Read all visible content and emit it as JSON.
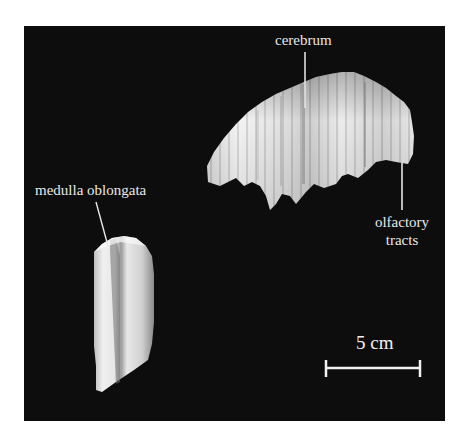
{
  "figure": {
    "background": "#0d0d0d",
    "labels": {
      "cerebrum": "cerebrum",
      "medulla": "medulla oblongata",
      "olfactory_line1": "olfactory",
      "olfactory_line2": "tracts"
    },
    "scale_bar": {
      "label": "5 cm"
    }
  }
}
